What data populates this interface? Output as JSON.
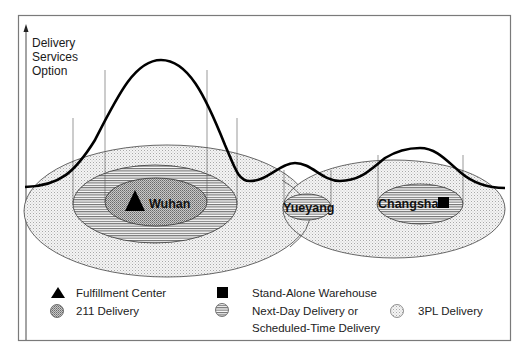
{
  "diagram": {
    "axis": {
      "label_lines": [
        "Delivery",
        "Services",
        "Option"
      ]
    },
    "cities": [
      {
        "name": "Wuhan",
        "facility": "Fulfillment Center",
        "services": [
          "211 Delivery",
          "Next-Day Delivery or Scheduled-Time Delivery",
          "3PL Delivery"
        ]
      },
      {
        "name": "Yueyang",
        "facility": "",
        "services": [
          "Next-Day Delivery or Scheduled-Time Delivery",
          "3PL Delivery"
        ]
      },
      {
        "name": "Changsha",
        "facility": "Stand-Alone Warehouse",
        "services": [
          "Next-Day Delivery or Scheduled-Time Delivery",
          "3PL Delivery"
        ]
      }
    ],
    "legend": {
      "fulfillment_center": "Fulfillment Center",
      "stand_alone_warehouse": "Stand-Alone Warehouse",
      "delivery_211": "211 Delivery",
      "next_day_line1": "Next-Day Delivery or",
      "next_day_line2": "Scheduled-Time Delivery",
      "delivery_3pl": "3PL Delivery"
    },
    "colors": {
      "frame": "#7a7a7a",
      "curve": "#000000",
      "pattern_211": "#9a9a9a",
      "pattern_hatch": "#6e6e6e",
      "pattern_3pl": "#b8b8b8"
    }
  }
}
